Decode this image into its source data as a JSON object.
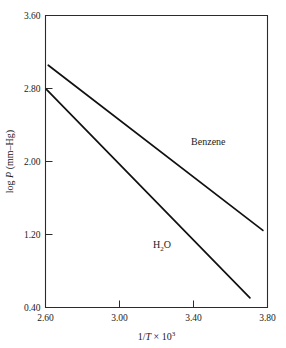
{
  "chart_data": {
    "type": "line",
    "title": "",
    "xlabel": "1/T × 10³",
    "ylabel": "log P (mm–Hg)",
    "xlabel_parts": {
      "pre": "1/",
      "ital": "T",
      "times": " × 10",
      "exp": "3"
    },
    "ylabel_parts": {
      "pre": "log ",
      "ital": "P",
      "post": " (mm–Hg)"
    },
    "xlim": [
      2.6,
      3.8
    ],
    "ylim": [
      0.4,
      3.6
    ],
    "xticks": [
      "2.60",
      "3.00",
      "3.40",
      "3.80"
    ],
    "xtick_values": [
      2.6,
      3.0,
      3.4,
      3.8
    ],
    "yticks": [
      "3.60",
      "2.80",
      "2.00",
      "1.20",
      "0.40"
    ],
    "ytick_values": [
      3.6,
      2.8,
      2.0,
      1.2,
      0.4
    ],
    "grid": false,
    "legend_position": "inline-annotation",
    "series": [
      {
        "name": "Benzene",
        "label": "Benzene",
        "label_x": 3.48,
        "label_y": 2.18,
        "x": [
          2.615,
          3.775
        ],
        "y": [
          3.055,
          1.245
        ],
        "endpoints": [
          {
            "x": 2.615,
            "y": 3.055
          },
          {
            "x": 3.775,
            "y": 1.245
          }
        ]
      },
      {
        "name": "H2O",
        "label": "H₂O",
        "label_parts": {
          "pre": "H",
          "sub": "2",
          "post": "O"
        },
        "label_x": 3.23,
        "label_y": 1.05,
        "x": [
          2.605,
          3.705
        ],
        "y": [
          2.79,
          0.505
        ],
        "endpoints": [
          {
            "x": 2.605,
            "y": 2.79
          },
          {
            "x": 3.705,
            "y": 0.505
          }
        ]
      }
    ],
    "colors": {
      "line": "#111111",
      "axis": "#2b2b2b",
      "background": "#ffffff",
      "text": "#1a1a1a"
    }
  }
}
